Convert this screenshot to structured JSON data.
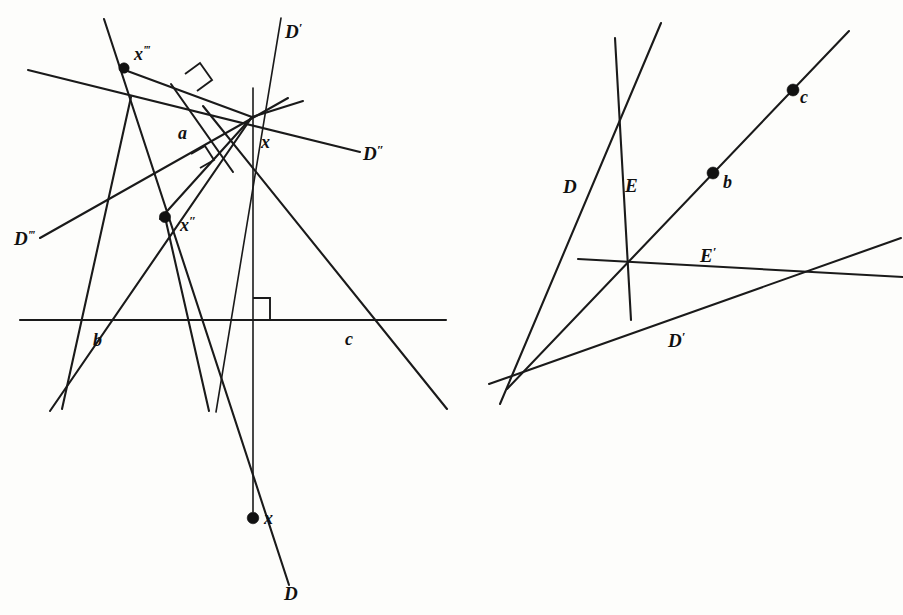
{
  "figure": {
    "background_color": "#fdfdfb",
    "ink_color": "#111111",
    "panels": [
      {
        "id": "left",
        "name": "left-construction-panel"
      },
      {
        "id": "right",
        "name": "right-construction-panel"
      }
    ]
  },
  "left_panel": {
    "name": "left-construction-panel",
    "labels": {
      "line_d_prime": "D",
      "line_d_prime_marks": "′",
      "line_d_double_prime": "D",
      "line_d_double_prime_marks": "″",
      "line_d_triple_prime": "D",
      "line_d_triple_prime_marks": "‴",
      "line_d": "D",
      "point_a": "a",
      "point_b": "b",
      "point_c": "c",
      "point_x": "x",
      "point_x_double": "x",
      "point_x_double_marks": "″",
      "point_x_triple": "x",
      "point_x_triple_marks": "‴",
      "point_x_bottom": "x"
    },
    "points": [
      {
        "name": "x-triple-prime-point",
        "label": "x‴",
        "cx": 124,
        "cy": 68,
        "r": 5.2
      },
      {
        "name": "x-double-prime-point",
        "label": "x″",
        "cx": 165,
        "cy": 217,
        "r": 5.6
      },
      {
        "name": "x-bottom-point",
        "label": "x",
        "cx": 253,
        "cy": 518,
        "r": 5.8
      }
    ],
    "vertex_x": {
      "x": 252,
      "y": 117
    },
    "baseline": {
      "y": 320,
      "x_start": 20,
      "x_end": 446
    },
    "baseline_points": {
      "b": {
        "x": 89,
        "y": 320
      },
      "c": {
        "x": 344,
        "y": 320
      },
      "foot": {
        "x": 253,
        "y": 320
      },
      "node": {
        "x": 198,
        "y": 320
      }
    }
  },
  "right_panel": {
    "name": "right-construction-panel",
    "labels": {
      "line_d": "D",
      "line_e": "E",
      "line_e_prime": "E",
      "line_e_prime_marks": "′",
      "line_d_prime": "D",
      "line_d_prime_marks": "′",
      "point_b": "b",
      "point_c": "c"
    },
    "points": [
      {
        "name": "b-point",
        "label": "b",
        "cx": 713,
        "cy": 173,
        "r": 6.0
      },
      {
        "name": "c-point",
        "label": "c",
        "cx": 793,
        "cy": 90,
        "r": 6.0
      },
      {
        "name": "apex-node",
        "cx": 525,
        "cy": 372,
        "r": 0
      },
      {
        "name": "center-node",
        "cx": 628,
        "cy": 265,
        "r": 0
      },
      {
        "name": "right-node",
        "cx": 797,
        "cy": 274,
        "r": 0
      }
    ]
  },
  "geometry": {
    "left": {
      "lines": [
        {
          "name": "baseline-horizontal",
          "x1": 20,
          "y1": 320,
          "x2": 446,
          "y2": 320,
          "w": "med"
        },
        {
          "name": "line-D-prime",
          "x1": 216,
          "y1": 412,
          "x2": 281,
          "y2": 18,
          "w": "thin"
        },
        {
          "name": "line-D-double-prime",
          "x1": 28,
          "y1": 70,
          "x2": 360,
          "y2": 152,
          "w": "med"
        },
        {
          "name": "line-D-triple-prime",
          "x1": 40,
          "y1": 238,
          "x2": 288,
          "y2": 98,
          "w": "med"
        },
        {
          "name": "line-D-main",
          "x1": 104,
          "y1": 19,
          "x2": 289,
          "y2": 585,
          "w": "med"
        },
        {
          "name": "line-through-x-to-lower-left",
          "x1": 252,
          "y1": 117,
          "x2": 50,
          "y2": 411,
          "w": "med"
        },
        {
          "name": "line-through-x-to-lower-right",
          "x1": 203,
          "y1": 106,
          "x2": 447,
          "y2": 409,
          "w": "med"
        },
        {
          "name": "vertical-through-x",
          "x1": 253,
          "y1": 88,
          "x2": 253,
          "y2": 512,
          "w": "thin"
        },
        {
          "name": "short-ray-upper-right-of-x",
          "x1": 252,
          "y1": 117,
          "x2": 303,
          "y2": 101,
          "w": "med"
        },
        {
          "name": "ray-x-to-x-double-prime",
          "x1": 252,
          "y1": 117,
          "x2": 160,
          "y2": 219,
          "w": "med"
        },
        {
          "name": "ray-x-to-x-triple-prime",
          "x1": 252,
          "y1": 117,
          "x2": 122,
          "y2": 69,
          "w": "med"
        },
        {
          "name": "line-x-double-prime-down",
          "x1": 165,
          "y1": 217,
          "x2": 209,
          "y2": 411,
          "w": "med"
        },
        {
          "name": "line-node-to-baseline-left",
          "x1": 131,
          "y1": 97,
          "x2": 62,
          "y2": 409,
          "w": "med"
        },
        {
          "name": "altitude-segment-upper",
          "x1": 171,
          "y1": 84,
          "x2": 233,
          "y2": 172,
          "w": "med"
        }
      ],
      "right_angle_marks": [
        {
          "name": "right-angle-upper",
          "points": "185,74 200,63 212,80 197,91",
          "variant": "square"
        },
        {
          "name": "right-angle-mid",
          "points": "191,154 205,146 214,160 200,168",
          "variant": "square"
        },
        {
          "name": "right-angle-baseline",
          "points": "253,298 270,298 270,320 253,320",
          "variant": "square"
        }
      ]
    },
    "right": {
      "lines": [
        {
          "name": "line-E-near-vertical",
          "x1": 615,
          "y1": 38,
          "x2": 631,
          "y2": 320,
          "w": "med"
        },
        {
          "name": "line-D-left",
          "x1": 661,
          "y1": 23,
          "x2": 500,
          "y2": 404,
          "w": "med"
        },
        {
          "name": "line-bc-diagonal",
          "x1": 849,
          "y1": 31,
          "x2": 507,
          "y2": 389,
          "w": "med"
        },
        {
          "name": "line-E-prime",
          "x1": 578,
          "y1": 259,
          "x2": 903,
          "y2": 277,
          "w": "med"
        },
        {
          "name": "line-D-prime",
          "x1": 489,
          "y1": 384,
          "x2": 901,
          "y2": 238,
          "w": "med"
        }
      ]
    }
  },
  "text_labels": {
    "left": [
      {
        "name": "label-D-prime",
        "text": "D",
        "prime": "′",
        "x": 285,
        "y": 38,
        "anchor": "start"
      },
      {
        "name": "label-D-double-prime",
        "text": "D",
        "prime": "″",
        "x": 363,
        "y": 160,
        "anchor": "start"
      },
      {
        "name": "label-D-triple-prime",
        "text": "D",
        "prime": "‴",
        "x": 14,
        "y": 245,
        "anchor": "start"
      },
      {
        "name": "label-D",
        "text": "D",
        "prime": "",
        "x": 284,
        "y": 600,
        "anchor": "start"
      },
      {
        "name": "label-a",
        "text": "a",
        "prime": "",
        "x": 178,
        "y": 139,
        "anchor": "start"
      },
      {
        "name": "label-b",
        "text": "b",
        "prime": "",
        "x": 93,
        "y": 346,
        "anchor": "start"
      },
      {
        "name": "label-c",
        "text": "c",
        "prime": "",
        "x": 345,
        "y": 345,
        "anchor": "start"
      },
      {
        "name": "label-x-vertex",
        "text": "x",
        "prime": "",
        "x": 261,
        "y": 148,
        "anchor": "start"
      },
      {
        "name": "label-x-double-prime",
        "text": "x",
        "prime": "″",
        "x": 180,
        "y": 231,
        "anchor": "start"
      },
      {
        "name": "label-x-triple-prime",
        "text": "x",
        "prime": "‴",
        "x": 134,
        "y": 60,
        "anchor": "start"
      },
      {
        "name": "label-x-bottom",
        "text": "x",
        "prime": "",
        "x": 264,
        "y": 524,
        "anchor": "start"
      }
    ],
    "right": [
      {
        "name": "label-D",
        "text": "D",
        "prime": "",
        "x": 563,
        "y": 193,
        "anchor": "start"
      },
      {
        "name": "label-E",
        "text": "E",
        "prime": "",
        "x": 625,
        "y": 192,
        "anchor": "start"
      },
      {
        "name": "label-E-prime",
        "text": "E",
        "prime": "′",
        "x": 700,
        "y": 262,
        "anchor": "start"
      },
      {
        "name": "label-D-prime",
        "text": "D",
        "prime": "′",
        "x": 668,
        "y": 347,
        "anchor": "start"
      },
      {
        "name": "label-b",
        "text": "b",
        "prime": "",
        "x": 723,
        "y": 188,
        "anchor": "start"
      },
      {
        "name": "label-c",
        "text": "c",
        "prime": "",
        "x": 800,
        "y": 103,
        "anchor": "start"
      }
    ]
  }
}
